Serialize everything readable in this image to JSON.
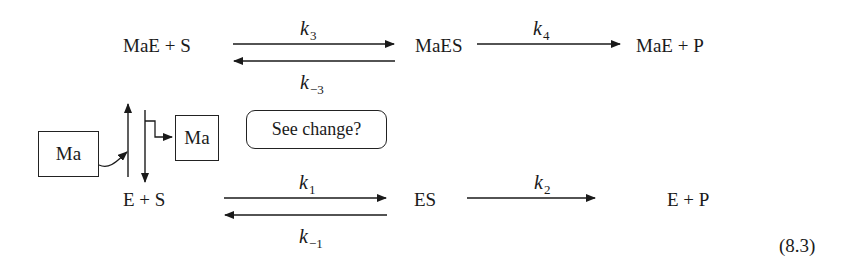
{
  "diagram": {
    "type": "enzyme-kinetics-reaction-scheme",
    "top_row": {
      "reactants": "MaE + S",
      "complex": "MaES",
      "products": "MaE + P",
      "k_forward": {
        "base": "k",
        "sub": "3"
      },
      "k_reverse": {
        "base": "k",
        "sub": "−3"
      },
      "k_cat": {
        "base": "k",
        "sub": "4"
      }
    },
    "bottom_row": {
      "reactants": "E + S",
      "complex": "ES",
      "products": "E + P",
      "k_forward": {
        "base": "k",
        "sub": "1"
      },
      "k_reverse": {
        "base": "k",
        "sub": "−1"
      },
      "k_cat": {
        "base": "k",
        "sub": "2"
      }
    },
    "modifier_left_box": "Ma",
    "modifier_right_box": "Ma",
    "question_bubble": "See change?",
    "equation_number": "(8.3)",
    "line_color": "#1a1a1a"
  }
}
